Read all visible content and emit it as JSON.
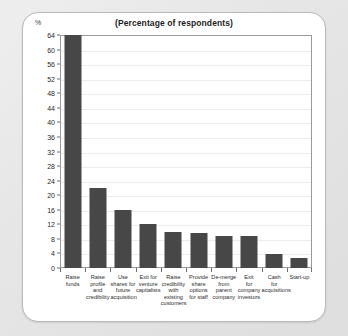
{
  "card": {
    "unit_label": "%",
    "title": "(Percentage of respondents)"
  },
  "chart_data": {
    "type": "bar",
    "title": "(Percentage of respondents)",
    "xlabel": "",
    "ylabel": "%",
    "ylim": [
      0,
      64
    ],
    "ytick_step": 4,
    "grid": true,
    "legend": "none",
    "bar_color": "#474747",
    "yticks": [
      0,
      4,
      8,
      12,
      16,
      20,
      24,
      28,
      32,
      36,
      40,
      44,
      48,
      52,
      56,
      60,
      64
    ],
    "categories": [
      "Raise funds",
      "Raise profile and credibility",
      "Use shares for future acquisition",
      "Exit for venture capitalists",
      "Raise credibility with existing customers",
      "Provide share options for staff",
      "De-merge from parent company",
      "Exit for company investors",
      "Cash for acquisitions",
      "Start-up"
    ],
    "category_lines": [
      [
        "Raise",
        "funds"
      ],
      [
        "Raise",
        "profile",
        "and",
        "credibility"
      ],
      [
        "Use",
        "shares for",
        "future",
        "acquisition"
      ],
      [
        "Exit for",
        "venture",
        "capitalists"
      ],
      [
        "Raise",
        "credibility",
        "with",
        "existing",
        "customers"
      ],
      [
        "Provide",
        "share",
        "options",
        "for staff"
      ],
      [
        "De-merge",
        "from",
        "parent",
        "company"
      ],
      [
        "Exit",
        "for",
        "company",
        "investors"
      ],
      [
        "Cash",
        "for",
        "acquisitions"
      ],
      [
        "Start-up"
      ]
    ],
    "values": [
      64,
      22,
      16,
      12,
      10,
      9.5,
      8.7,
      8.7,
      3.8,
      2.7
    ]
  }
}
